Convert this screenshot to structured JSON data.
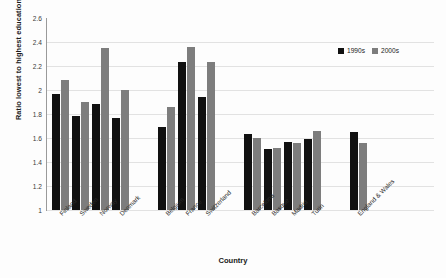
{
  "chart_data": {
    "type": "bar",
    "title": "",
    "xlabel": "Country",
    "ylabel": "Ratio lowest to highest education",
    "ylim": [
      1,
      2.6
    ],
    "ytick_step": 0.2,
    "yticks": [
      "1",
      "1.2",
      "1.4",
      "1.6",
      "1.8",
      "2",
      "2.2",
      "2.4",
      "2.6"
    ],
    "grid": true,
    "legend_position": "top-right",
    "categories": [
      "Finland",
      "Sweden",
      "Norway",
      "Denmark",
      "Belgium",
      "France",
      "Switzerland",
      "Barcelona",
      "Basque",
      "Madrid",
      "Turin",
      "England & Wales"
    ],
    "group_breaks_after": [
      "Denmark",
      "Switzerland",
      "Turin"
    ],
    "series": [
      {
        "name": "1990s",
        "color": "#111111",
        "values": [
          1.97,
          1.78,
          1.88,
          1.77,
          1.69,
          2.23,
          1.94,
          1.63,
          1.51,
          1.57,
          1.59,
          1.65
        ]
      },
      {
        "name": "2000s",
        "color": "#7d7d7d",
        "values": [
          2.08,
          1.9,
          2.35,
          2.0,
          1.86,
          2.36,
          2.23,
          1.6,
          1.52,
          1.56,
          1.66,
          1.56
        ]
      }
    ]
  },
  "legend": {
    "items": [
      {
        "label": "1990s",
        "color": "#111111"
      },
      {
        "label": "2000s",
        "color": "#7d7d7d"
      }
    ]
  },
  "axes": {
    "x_title": "Country",
    "y_title": "Ratio lowest to highest education"
  }
}
